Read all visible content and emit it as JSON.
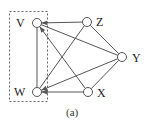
{
  "figure": {
    "caption": "(a)",
    "stroke_color": "#555555",
    "node_fill": "#ffffff",
    "group_box": {
      "members": [
        "V",
        "W"
      ],
      "style": "dashed"
    }
  },
  "nodes": [
    {
      "id": "V",
      "label": "V",
      "x": 37,
      "y": 23
    },
    {
      "id": "Z",
      "label": "Z",
      "x": 87,
      "y": 22
    },
    {
      "id": "Y",
      "label": "Y",
      "x": 122,
      "y": 57
    },
    {
      "id": "W",
      "label": "W",
      "x": 37,
      "y": 92
    },
    {
      "id": "X",
      "label": "X",
      "x": 88,
      "y": 92
    }
  ],
  "edges": [
    {
      "from": "Z",
      "to": "V",
      "arrow": true
    },
    {
      "from": "V",
      "to": "W",
      "arrow": false
    },
    {
      "from": "V",
      "to": "Y",
      "arrow": false
    },
    {
      "from": "X",
      "to": "V",
      "arrow": true
    },
    {
      "from": "W",
      "to": "Z",
      "arrow": false
    },
    {
      "from": "Y",
      "to": "W",
      "arrow": true
    },
    {
      "from": "X",
      "to": "W",
      "arrow": true
    },
    {
      "from": "Z",
      "to": "Y",
      "arrow": false
    },
    {
      "from": "X",
      "to": "Y",
      "arrow": false
    }
  ]
}
